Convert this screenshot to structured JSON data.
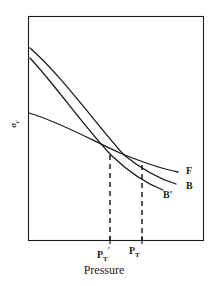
{
  "figure": {
    "kind": "line-diagram",
    "background_color": "#ffffff",
    "line_color": "#1a1a1a",
    "frame": {
      "x0": 28,
      "y0": 16,
      "x1": 203,
      "y1": 240
    }
  },
  "axes": {
    "x_axis_title": "Pressure",
    "y_axis_symbol": "σ",
    "y_axis_subscript": "c",
    "y_axis_label_text": "σc",
    "x_ticks": [
      {
        "label_main": "P",
        "label_sub": "T",
        "label_prime": "′",
        "label_text": "PT′",
        "x": 110
      },
      {
        "label_main": "P",
        "label_sub": "T",
        "label_prime": "",
        "label_text": "PT",
        "x": 142
      }
    ]
  },
  "curves": [
    {
      "name": "F",
      "label": "F",
      "label_x": 186,
      "label_y": 166,
      "description": "shallow nearly-straight falling line from left axis",
      "path": "M 29,113 C 60,122 95,142 120,153 C 142,162 162,169 178,172",
      "dashed": false
    },
    {
      "name": "B",
      "label": "B",
      "label_x": 186,
      "label_y": 181,
      "description": "upper steep convex falling curve",
      "path": "M 30,48 C 62,76 96,124 124,155 C 145,172 163,180 176,184",
      "dashed": false
    },
    {
      "name": "Bprime",
      "label": "B′",
      "label_x": 163,
      "label_y": 190,
      "description": "lower steep convex falling curve",
      "path": "M 30,58 C 56,86 86,129 112,156 C 131,174 150,185 163,190",
      "dashed": false
    }
  ],
  "dashed_drop_lines": [
    {
      "name": "drop-line-pt-prime",
      "x": 110,
      "y_top": 155,
      "y_bottom": 240
    },
    {
      "name": "drop-line-pt",
      "x": 142,
      "y_top": 165,
      "y_bottom": 240
    }
  ],
  "intersections": [
    {
      "name": "intersection-f-bprime",
      "x": 110,
      "y": 155
    },
    {
      "name": "intersection-f-b",
      "x": 142,
      "y": 165
    }
  ],
  "chart_data": {
    "type": "line",
    "title": "",
    "xlabel": "Pressure",
    "ylabel": "σc",
    "grid": false,
    "legend_position": "inline-right",
    "series": [
      {
        "name": "F",
        "note": "shallow decreasing curve"
      },
      {
        "name": "B",
        "note": "steep decreasing curve, crosses F at PT"
      },
      {
        "name": "B′",
        "note": "steep decreasing curve, crosses F at PT′"
      }
    ],
    "annotations": [
      "PT′",
      "PT"
    ]
  }
}
